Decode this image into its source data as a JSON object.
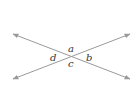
{
  "diagram": {
    "type": "intersecting-lines",
    "line_color": "#9a9a9a",
    "labels": {
      "a": "a",
      "b": "b",
      "c": "c",
      "d": "d"
    }
  }
}
